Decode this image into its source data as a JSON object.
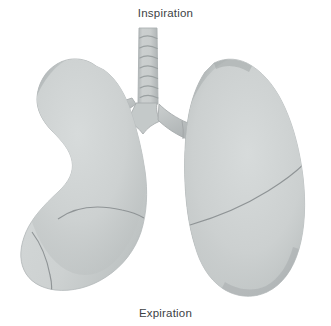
{
  "figure": {
    "name": "human-lungs-respiration-diagram",
    "background_color": "#ffffff",
    "width": 331,
    "height": 326,
    "labels": {
      "top": "Inspiration",
      "bottom": "Expiration"
    },
    "colors": {
      "organ_fill_light": "#d2d6d6",
      "organ_fill_mid": "#c5caca",
      "organ_edge_shadow": "#a4a9aa",
      "organ_outline": "#b6babb",
      "fissure_line": "#8f9496",
      "trachea_fill": "#c9cdcd",
      "trachea_ring": "#9aa0a1",
      "text": "#3d4245"
    },
    "parts": [
      {
        "name": "trachea",
        "label": "Trachea",
        "cartilage_rings": 7
      },
      {
        "name": "carina",
        "label": "Carina"
      },
      {
        "name": "left-main-bronchus",
        "label": "Left main bronchus"
      },
      {
        "name": "right-main-bronchus",
        "label": "Right main bronchus"
      },
      {
        "name": "left-lung",
        "label": "Left lung",
        "fissures": 2
      },
      {
        "name": "right-lung",
        "label": "Right lung",
        "fissures": 1
      }
    ]
  }
}
